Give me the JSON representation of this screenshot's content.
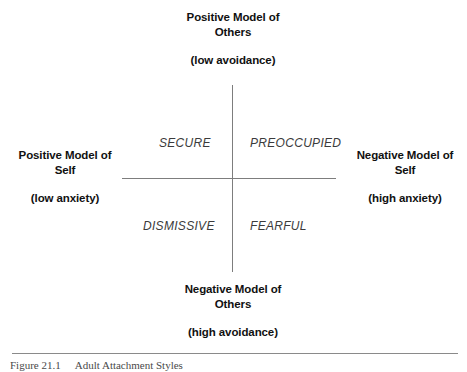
{
  "figure": {
    "type": "two-by-two-quadrant-matrix",
    "axes": {
      "vertical": {
        "top_label": "Positive Model of\nOthers",
        "top_sub_label": "(low avoidance)",
        "bottom_label": "Negative Model of\nOthers",
        "bottom_sub_label": "(high avoidance)"
      },
      "horizontal": {
        "left_label": "Positive Model of\nSelf",
        "left_sub_label": "(low anxiety)",
        "right_label": "Negative Model of\nSelf",
        "right_sub_label": "(high anxiety)"
      }
    },
    "quadrants": [
      {
        "id": "top-left",
        "label": "SECURE"
      },
      {
        "id": "top-right",
        "label": "PREOCCUPIED"
      },
      {
        "id": "bottom-left",
        "label": "DISMISSIVE"
      },
      {
        "id": "bottom-right",
        "label": "FEARFUL"
      }
    ],
    "caption": {
      "number": "Figure  21.1",
      "text": "Adult Attachment Styles"
    },
    "colors": {
      "background": "#ffffff",
      "axis_line": "#7d7d7d",
      "rule_line": "#8a8a8a",
      "pole_text": "#111111",
      "quadrant_text": "#3b3b3b",
      "caption_text": "#4a4a4a"
    }
  }
}
